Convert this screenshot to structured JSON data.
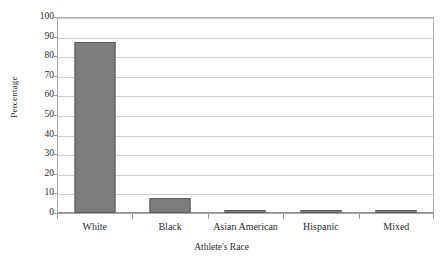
{
  "chart_data": {
    "type": "bar",
    "title": "",
    "xlabel": "Athlete's Race",
    "ylabel": "Percentage",
    "categories": [
      "White",
      "Black",
      "Asian American",
      "Hispanic",
      "Mixed"
    ],
    "values": [
      87.5,
      7.5,
      0.6,
      1.2,
      1.3
    ],
    "ylim": [
      0,
      100
    ],
    "ytick_labels": [
      "100",
      "90",
      "80",
      "70",
      "60",
      "50",
      "40",
      "30",
      "20",
      "10",
      "0"
    ],
    "ytick_values": [
      100,
      90,
      80,
      70,
      60,
      50,
      40,
      30,
      20,
      10,
      0
    ],
    "grid": true,
    "legend": false,
    "series": [
      {
        "name": "Percentage",
        "values": [
          87.5,
          7.5,
          0.6,
          1.2,
          1.3
        ]
      }
    ],
    "colors": {
      "bar_fill": "#7d7d7d",
      "bar_border": "#5b5b5b",
      "gridline": "#cfcfcf",
      "axis": "#8d8d8d",
      "text": "#2b2b2b",
      "background": "#ffffff"
    }
  }
}
